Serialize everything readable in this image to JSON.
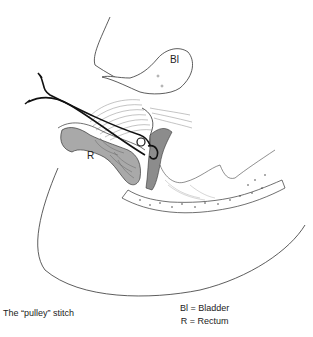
{
  "figure": {
    "caption": "The “pulley” stitch",
    "organ_labels": {
      "bladder": "Bl",
      "rectum": "R"
    },
    "legend": [
      {
        "abbr": "Bl",
        "text": "Bl = Bladder"
      },
      {
        "abbr": "R",
        "text": "R = Rectum"
      }
    ],
    "colors": {
      "outline": "#333333",
      "rectum_fill": "#a9a9a9",
      "muscle_fill": "#8c8c8c",
      "suture": "#111111",
      "background": "#ffffff"
    }
  }
}
